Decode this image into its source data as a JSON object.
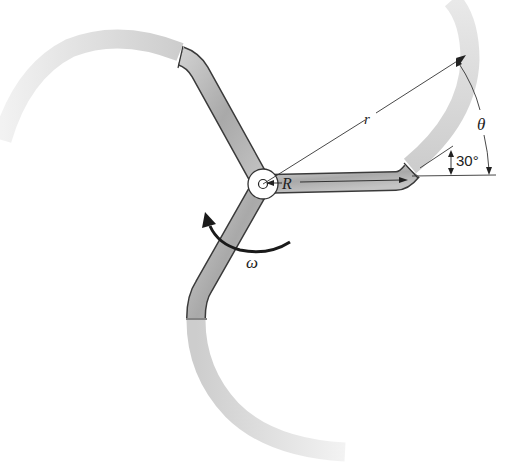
{
  "figure": {
    "type": "sprinkler-rotor",
    "colors": {
      "arm_fill": "#b8b8b8",
      "arm_stroke": "#3a3a3a",
      "spray": "#d6d6d6",
      "line": "#333333",
      "background": "#ffffff"
    }
  },
  "labels": {
    "r": "r",
    "R": "R",
    "theta": "θ",
    "angle": "30°",
    "omega": "ω"
  },
  "annotations": {
    "radius_outer": "r",
    "radius_arm": "R",
    "arm_tip_angle_deg": 30,
    "spray_angle": "θ",
    "rotation": "ω"
  }
}
